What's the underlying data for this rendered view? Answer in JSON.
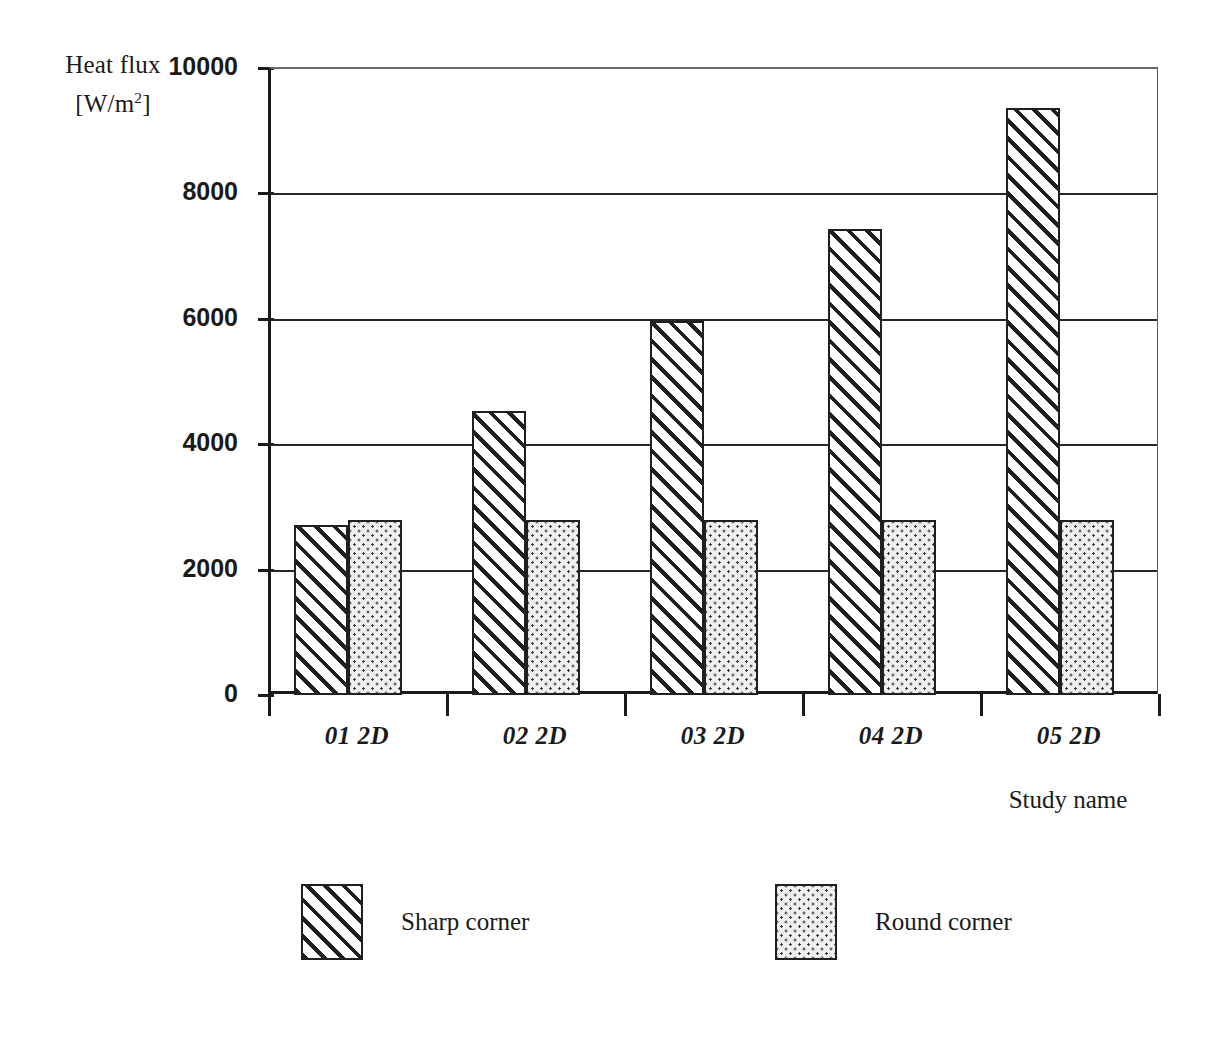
{
  "chart_data": {
    "type": "bar",
    "title": "",
    "subtitle": "",
    "xlabel": "Study name",
    "ylabel": "Heat flux [W/m²]",
    "ylabel_line1": "Heat flux",
    "ylabel_line2_prefix": "[W/m",
    "ylabel_line2_sup": "2",
    "ylabel_line2_suffix": "]",
    "categories": [
      "01 2D",
      "02 2D",
      "03 2D",
      "04 2D",
      "05 2D"
    ],
    "series": [
      {
        "name": "Sharp corner",
        "pattern": "diagonal-hatch",
        "values": [
          2710,
          4530,
          5960,
          7430,
          9360
        ]
      },
      {
        "name": "Round corner",
        "pattern": "dotted",
        "values": [
          2790,
          2790,
          2790,
          2790,
          2790
        ]
      }
    ],
    "ylim": [
      0,
      10000
    ],
    "yticks": [
      0,
      2000,
      4000,
      6000,
      8000,
      10000
    ],
    "ytick_labels": [
      "0",
      "2000",
      "4000",
      "6000",
      "8000",
      "10000"
    ],
    "grid": "horizontal",
    "legend_position": "bottom",
    "units": "W/m^2",
    "colors": {
      "axis": "#1a1a1a",
      "grid": "#262626",
      "bar_outline": "#1f1f1f",
      "hatch": "#1f1f1f",
      "dot_fill": "#efefef",
      "background": "#ffffff"
    }
  },
  "legend": {
    "items": [
      {
        "label": "Sharp corner",
        "swatch": "hatch-swatch"
      },
      {
        "label": "Round corner",
        "swatch": "dots-swatch"
      }
    ]
  }
}
